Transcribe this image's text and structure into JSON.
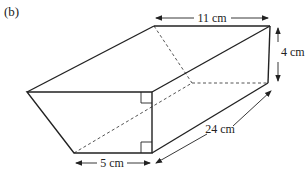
{
  "figure": {
    "label": "(b)",
    "shape": "trapezoidal prism",
    "colors": {
      "line": "#222222",
      "dashed": "#555555",
      "background": "#ffffff"
    }
  },
  "dimensions": {
    "top_width": "11 cm",
    "height": "4 cm",
    "length": "24 cm",
    "bottom_width": "5 cm"
  },
  "vertices": {
    "front_top_left": [
      27,
      92
    ],
    "front_top_right": [
      152,
      92
    ],
    "front_bottom_right": [
      152,
      153
    ],
    "front_bottom_left": [
      74,
      153
    ],
    "back_top_left": [
      154,
      26
    ],
    "back_top_right": [
      270,
      26
    ],
    "back_bottom_right": [
      268,
      83
    ],
    "back_bottom_left": [
      192,
      83
    ]
  },
  "annotations": {
    "right_angle_marks": 2
  }
}
